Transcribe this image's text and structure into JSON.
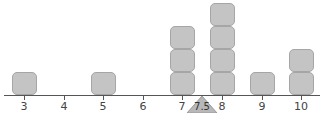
{
  "chart_data": {
    "type": "dot-plot",
    "title": "",
    "xlabel": "",
    "ylabel": "",
    "categories": [
      3,
      4,
      5,
      6,
      7,
      8,
      9,
      10
    ],
    "values": [
      1,
      0,
      1,
      0,
      3,
      4,
      1,
      2
    ],
    "xlim": [
      2.5,
      10.5
    ],
    "grid": false,
    "legend": null,
    "annotations": [
      {
        "type": "balance-point-triangle",
        "x": 7.5,
        "label": "7.5"
      }
    ],
    "colors": {
      "block_fill": "#c4c4c4",
      "block_border": "#a6a6a6",
      "axis": "#555555",
      "fulcrum": "#b8b8b8"
    }
  },
  "axis": {
    "tick_labels": [
      "3",
      "4",
      "5",
      "6",
      "7",
      "8",
      "9",
      "10"
    ]
  },
  "mean_marker": {
    "label": "7.5"
  }
}
